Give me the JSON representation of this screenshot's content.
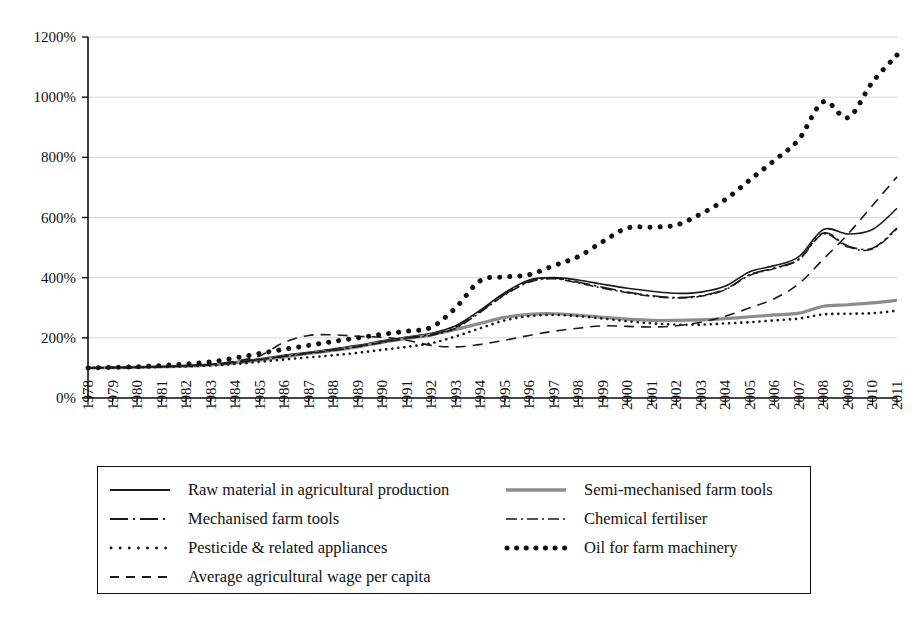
{
  "chart_data": {
    "type": "line",
    "title": "",
    "xlabel": "",
    "ylabel": "",
    "ylim": [
      0,
      1200
    ],
    "ytick_labels": [
      "0%",
      "200%",
      "400%",
      "600%",
      "800%",
      "1000%",
      "1200%"
    ],
    "yticks": [
      0,
      200,
      400,
      600,
      800,
      1000,
      1200
    ],
    "grid": true,
    "grid_axis": "y",
    "legend_position": "bottom",
    "legend_columns": 2,
    "categories": [
      1978,
      1979,
      1980,
      1981,
      1982,
      1983,
      1984,
      1985,
      1986,
      1987,
      1988,
      1989,
      1990,
      1991,
      1992,
      1993,
      1994,
      1995,
      1996,
      1997,
      1998,
      1999,
      2000,
      2001,
      2002,
      2003,
      2004,
      2005,
      2006,
      2007,
      2008,
      2009,
      2010,
      2011
    ],
    "xtick_labels": [
      "1978",
      "1979",
      "1980",
      "1981",
      "1982",
      "1983",
      "1984",
      "1985",
      "1986",
      "1987",
      "1988",
      "1989",
      "1990",
      "1991",
      "1992",
      "1993",
      "1994",
      "1995",
      "1996",
      "1997",
      "1998",
      "1999",
      "2000",
      "2001",
      "2002",
      "2003",
      "2004",
      "2005",
      "2006",
      "2007",
      "2008",
      "2009",
      "2010",
      "2011"
    ],
    "series": [
      {
        "name": "Raw material in agricultural production",
        "style": "solid",
        "color": "#1a1a1a",
        "width": 1.6,
        "values": [
          100,
          101,
          103,
          105,
          108,
          112,
          120,
          130,
          142,
          152,
          163,
          175,
          190,
          203,
          215,
          240,
          292,
          350,
          392,
          400,
          392,
          378,
          365,
          355,
          348,
          352,
          372,
          420,
          440,
          470,
          560,
          545,
          560,
          630
        ]
      },
      {
        "name": "Semi-mechanised farm tools",
        "style": "solid",
        "color": "#8c8c8c",
        "width": 3.2,
        "values": [
          100,
          101,
          102,
          104,
          106,
          110,
          117,
          126,
          137,
          148,
          158,
          170,
          185,
          198,
          210,
          228,
          248,
          268,
          278,
          280,
          275,
          268,
          262,
          258,
          258,
          260,
          264,
          270,
          276,
          282,
          305,
          310,
          316,
          325
        ]
      },
      {
        "name": "Mechanised farm tools",
        "style": "dashdot-long",
        "color": "#1a1a1a",
        "width": 1.6,
        "values": [
          100,
          101,
          102,
          104,
          107,
          111,
          118,
          128,
          139,
          150,
          160,
          172,
          187,
          200,
          212,
          235,
          288,
          345,
          388,
          398,
          385,
          368,
          352,
          340,
          334,
          340,
          362,
          410,
          432,
          462,
          548,
          505,
          498,
          565
        ]
      },
      {
        "name": "Chemical fertiliser",
        "style": "dashdot-short",
        "color": "#1a1a1a",
        "width": 1.5,
        "values": [
          100,
          101,
          102,
          104,
          107,
          110,
          117,
          127,
          138,
          148,
          158,
          170,
          184,
          198,
          208,
          232,
          285,
          342,
          385,
          396,
          382,
          365,
          350,
          338,
          332,
          338,
          360,
          408,
          430,
          460,
          545,
          502,
          495,
          562
        ]
      },
      {
        "name": "Pesticide & related appliances",
        "style": "dotted-small",
        "color": "#1a1a1a",
        "width": 2.6,
        "values": [
          100,
          101,
          102,
          103,
          105,
          108,
          113,
          120,
          128,
          135,
          142,
          150,
          160,
          170,
          182,
          205,
          232,
          258,
          272,
          276,
          272,
          264,
          255,
          248,
          244,
          244,
          248,
          252,
          258,
          264,
          278,
          280,
          282,
          290
        ]
      },
      {
        "name": "Oil for farm machinery",
        "style": "dotted-large",
        "color": "#111111",
        "width": 5.0,
        "values": [
          100,
          102,
          104,
          108,
          113,
          120,
          133,
          148,
          162,
          175,
          188,
          200,
          212,
          222,
          235,
          300,
          390,
          402,
          410,
          440,
          470,
          520,
          565,
          568,
          575,
          612,
          660,
          725,
          790,
          860,
          985,
          932,
          1050,
          1140
        ]
      },
      {
        "name": "Average agricultural wage per capita",
        "style": "dashed",
        "color": "#1a1a1a",
        "width": 1.6,
        "values": [
          100,
          101,
          102,
          104,
          107,
          112,
          122,
          140,
          185,
          208,
          210,
          205,
          202,
          192,
          175,
          170,
          178,
          192,
          208,
          222,
          232,
          240,
          238,
          236,
          240,
          252,
          272,
          300,
          330,
          380,
          462,
          545,
          640,
          735
        ]
      }
    ]
  },
  "legend": {
    "items": [
      {
        "label": "Raw material in agricultural production",
        "icon": "solid-line-icon"
      },
      {
        "label": "Semi-mechanised farm tools",
        "icon": "thick-gray-line-icon"
      },
      {
        "label": "Mechanised farm tools",
        "icon": "dash-dot-line-icon"
      },
      {
        "label": "Chemical fertiliser",
        "icon": "dash-dot-short-line-icon"
      },
      {
        "label": "Pesticide & related appliances",
        "icon": "dotted-line-icon"
      },
      {
        "label": "Oil for farm machinery",
        "icon": "thick-dotted-line-icon"
      },
      {
        "label": "Average agricultural wage per capita",
        "icon": "dashed-line-icon"
      }
    ]
  }
}
